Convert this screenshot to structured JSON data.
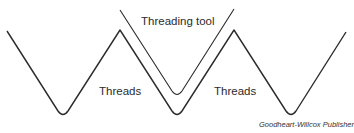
{
  "diagram": {
    "labels": {
      "threading_tool": "Threading tool",
      "threads_left": "Threads",
      "threads_right": "Threads",
      "credit": "Goodheart-Willcox Publisher"
    },
    "colors": {
      "line": "#2b2b2b",
      "background": "#ffffff"
    }
  }
}
